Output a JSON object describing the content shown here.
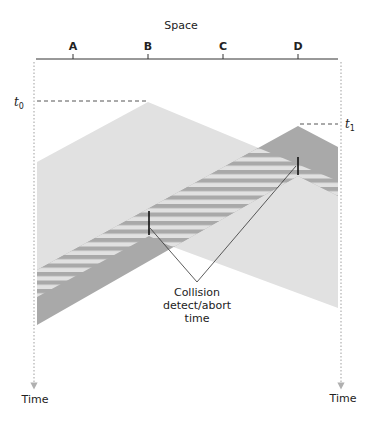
{
  "title": "Space",
  "stations": [
    {
      "label": "A",
      "x": 73
    },
    {
      "label": "B",
      "x": 148
    },
    {
      "label": "C",
      "x": 223
    },
    {
      "label": "D",
      "x": 298
    }
  ],
  "time_markers": {
    "t0": {
      "base": "t",
      "sub": "0"
    },
    "t1": {
      "base": "t",
      "sub": "1"
    }
  },
  "time_axis": {
    "left_label": "Time",
    "right_label": "Time"
  },
  "callout": {
    "line1": "Collision",
    "line2": "detect/abort",
    "line3": "time"
  },
  "colors": {
    "light_region": "#e1e1e1",
    "dark_region": "#a9a9a9",
    "axis": "#333333",
    "dotted": "#b0b0b0"
  }
}
